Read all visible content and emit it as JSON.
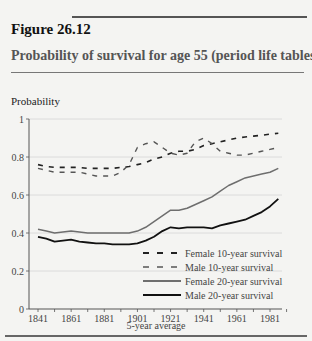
{
  "figure": {
    "number": "Figure 26.12",
    "title": "Probability of survival for age 55 (period life tables)"
  },
  "chart_data": {
    "type": "line",
    "title": "Probability of survival for age 55 (period life tables)",
    "xlabel": "5-year average",
    "ylabel": "Probability",
    "ylim": [
      0,
      1
    ],
    "yticks": [
      0,
      0.2,
      0.4,
      0.6,
      0.8,
      1
    ],
    "ytick_labels": [
      "0",
      "0.2",
      "0.4",
      "0.6",
      "0.8",
      "1"
    ],
    "xtick_labels": [
      "1841",
      "1861",
      "1881",
      "1901",
      "1921",
      "1941",
      "1961",
      "1981"
    ],
    "grid": "horizontal",
    "legend_position": "lower right",
    "x": [
      1841,
      1846,
      1851,
      1856,
      1861,
      1866,
      1871,
      1876,
      1881,
      1886,
      1891,
      1896,
      1901,
      1906,
      1911,
      1916,
      1921,
      1926,
      1931,
      1936,
      1941,
      1946,
      1951,
      1956,
      1961,
      1966,
      1971,
      1976,
      1981,
      1986
    ],
    "series": [
      {
        "name": "Female 10-year survival",
        "style": "dashed-dark",
        "values": [
          0.76,
          0.75,
          0.745,
          0.745,
          0.745,
          0.745,
          0.74,
          0.74,
          0.74,
          0.74,
          0.745,
          0.75,
          0.76,
          0.77,
          0.79,
          0.8,
          0.82,
          0.83,
          0.83,
          0.84,
          0.86,
          0.87,
          0.88,
          0.89,
          0.9,
          0.905,
          0.91,
          0.915,
          0.92,
          0.925
        ]
      },
      {
        "name": "Male 10-year survival",
        "style": "dashed-grey",
        "values": [
          0.74,
          0.73,
          0.72,
          0.72,
          0.72,
          0.72,
          0.71,
          0.7,
          0.7,
          0.7,
          0.72,
          0.76,
          0.85,
          0.87,
          0.88,
          0.85,
          0.82,
          0.81,
          0.82,
          0.88,
          0.9,
          0.87,
          0.83,
          0.82,
          0.81,
          0.81,
          0.82,
          0.83,
          0.84,
          0.85
        ]
      },
      {
        "name": "Female 20-year survival",
        "style": "solid-grey",
        "values": [
          0.42,
          0.41,
          0.4,
          0.405,
          0.41,
          0.405,
          0.4,
          0.4,
          0.4,
          0.4,
          0.4,
          0.4,
          0.41,
          0.43,
          0.46,
          0.49,
          0.52,
          0.52,
          0.53,
          0.55,
          0.57,
          0.59,
          0.62,
          0.65,
          0.67,
          0.69,
          0.7,
          0.71,
          0.72,
          0.74
        ]
      },
      {
        "name": "Male 20-year survival",
        "style": "solid-black",
        "values": [
          0.38,
          0.37,
          0.355,
          0.36,
          0.365,
          0.355,
          0.35,
          0.345,
          0.345,
          0.34,
          0.34,
          0.34,
          0.345,
          0.36,
          0.38,
          0.41,
          0.43,
          0.425,
          0.43,
          0.43,
          0.43,
          0.425,
          0.44,
          0.45,
          0.46,
          0.47,
          0.49,
          0.51,
          0.54,
          0.58
        ]
      }
    ]
  },
  "colors": {
    "background": "#f4f4f2",
    "female_10": "#222222",
    "male_10": "#555555",
    "female_20": "#6e6e6e",
    "male_20": "#111111",
    "grid": "#d6d6d6"
  }
}
